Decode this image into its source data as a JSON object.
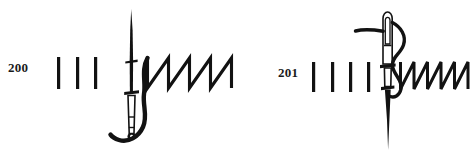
{
  "plate": {
    "width": 471,
    "height": 162,
    "background_color": "#ffffff",
    "ink_color": "#121212",
    "figure_count": 2
  },
  "figures": [
    {
      "id": "200",
      "label": "200",
      "label_x": 8,
      "label_y": 61,
      "description": "sewing needle with threaded eye at lower end, point uppermost",
      "tally_strokes": {
        "count": 3,
        "x_positions": [
          58,
          77,
          95
        ],
        "top": 57,
        "bottom": 89,
        "width": 3
      },
      "needle": {
        "orientation": "point-up",
        "axis_x": 131,
        "point_y": 10,
        "base_y": 138,
        "collar_positions": [
          62,
          92
        ],
        "eye_top": 95,
        "eye_bottom": 133
      },
      "zigzag": {
        "type": "sawtooth",
        "teeth": 4,
        "x_start": 146,
        "x_end": 232,
        "crest_y": 58,
        "trough_y": 88
      },
      "thread": {
        "present": true,
        "path_note": "S-curve from zigzag start looping under needle eye"
      }
    },
    {
      "id": "201",
      "label": "201",
      "label_x": 278,
      "label_y": 66,
      "description": "sewing needle with threaded eye uppermost, point downwards",
      "tally_strokes": {
        "count": 4,
        "x_positions": [
          313,
          332,
          350,
          368
        ],
        "top": 62,
        "bottom": 92,
        "width": 3
      },
      "needle": {
        "orientation": "point-down",
        "axis_x": 387,
        "eye_top": 12,
        "eye_bottom": 50,
        "collar_positions": [
          66,
          88
        ],
        "point_y": 150
      },
      "zigzag": {
        "type": "sawtooth",
        "teeth": 5,
        "x_start": 400,
        "x_end": 466,
        "crest_y": 62,
        "trough_y": 89
      },
      "thread": {
        "present": true,
        "path_note": "horizontal tail at left entering eye, long loop descending on right into zigzag"
      }
    }
  ]
}
